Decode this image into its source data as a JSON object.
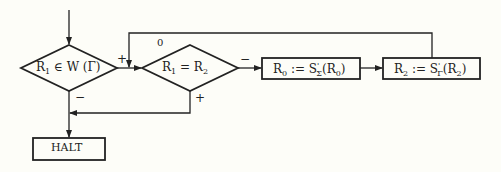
{
  "diagram": {
    "type": "flowchart",
    "nodes": [
      {
        "id": "decision-membership",
        "shape": "diamond",
        "label": "R₁ ∈ W(Γ)"
      },
      {
        "id": "decision-equal",
        "shape": "diamond",
        "label": "R₁ = R₂"
      },
      {
        "id": "process-r0",
        "shape": "rectangle",
        "label": "R₀ := S'Σ(R₀)"
      },
      {
        "id": "process-r2",
        "shape": "rectangle",
        "label": "R₂ := S'Γ(R₂)"
      },
      {
        "id": "halt",
        "shape": "rectangle",
        "label": "HALT"
      }
    ],
    "edges": [
      {
        "from": "start",
        "to": "decision-membership",
        "label": ""
      },
      {
        "from": "decision-membership",
        "to": "decision-equal",
        "label": "+"
      },
      {
        "from": "decision-membership",
        "to": "halt",
        "label": "−"
      },
      {
        "from": "decision-equal",
        "to": "process-r0",
        "label": "−"
      },
      {
        "from": "decision-equal",
        "to": "halt",
        "label": "+"
      },
      {
        "from": "process-r0",
        "to": "process-r2",
        "label": ""
      },
      {
        "from": "process-r2",
        "to": "decision-equal",
        "label": "0"
      }
    ]
  },
  "labels": {
    "d1": {
      "r": "R",
      "sub": "1",
      "rest": " ∈ W (Γ)"
    },
    "d2": {
      "r1": "R",
      "sub1": "1",
      "eq": " = ",
      "r2": "R",
      "sub2": "2"
    },
    "b1": {
      "r": "R",
      "sub": "0",
      "assign": " := S",
      "sup": "'",
      "subs": "Σ",
      "arg": "(R",
      "argsub": "0",
      "close": ")"
    },
    "b2": {
      "r": "R",
      "sub": "2",
      "assign": " := S",
      "sup": "'",
      "subs": "Γ",
      "arg": "(R",
      "argsub": "2",
      "close": ")"
    },
    "halt": "HALT",
    "plus_d1": "+",
    "minus_d1": "−",
    "minus_d2": "−",
    "plus_d2": "+",
    "zero_loop": "0"
  }
}
